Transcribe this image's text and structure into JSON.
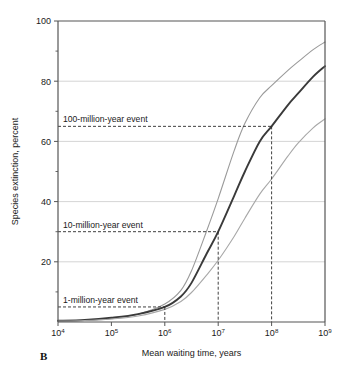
{
  "figure": {
    "panel_label": "B",
    "background_color": "#ffffff"
  },
  "chart_data": {
    "type": "line",
    "title": "",
    "xlabel": "Mean waiting time, years",
    "ylabel": "Species extinction, percent",
    "xscale": "log",
    "xlim": [
      10000,
      1000000000
    ],
    "ylim": [
      0,
      100
    ],
    "grid": "horizontal",
    "legend_position": "none",
    "xticks": [
      10000,
      100000,
      1000000,
      10000000,
      100000000,
      1000000000
    ],
    "xtick_labels": [
      "10⁴",
      "10⁵",
      "10⁶",
      "10⁷",
      "10⁸",
      "10⁹"
    ],
    "xtick_bases": [
      "10",
      "10",
      "10",
      "10",
      "10",
      "10"
    ],
    "xtick_exponents": [
      "4",
      "5",
      "6",
      "7",
      "8",
      "9"
    ],
    "yticks": [
      0,
      20,
      40,
      60,
      80,
      100
    ],
    "ytick_labels": [
      "",
      "20",
      "40",
      "60",
      "80",
      "100"
    ],
    "yticks_minor": [
      10,
      30,
      50,
      70,
      90
    ],
    "gridline_values": [
      20,
      40,
      60,
      80
    ],
    "series": [
      {
        "name": "upper-bound",
        "color": "#9a9a9a",
        "width": 1.1,
        "x": [
          10000,
          31623,
          100000,
          316228,
          1000000,
          2000000,
          3162278,
          6000000,
          10000000,
          20000000,
          31622777,
          60000000,
          100000000,
          200000000,
          316227766,
          600000000,
          1000000000
        ],
        "y": [
          0.3,
          0.5,
          1.1,
          2.6,
          6.0,
          10.5,
          17.0,
          30.0,
          41.0,
          57.0,
          66.0,
          74.5,
          78.5,
          83.5,
          86.5,
          90.5,
          93.0
        ]
      },
      {
        "name": "best-estimate",
        "color": "#3a3a3a",
        "width": 1.9,
        "x": [
          10000,
          31623,
          100000,
          316228,
          1000000,
          2000000,
          3162278,
          6000000,
          10000000,
          20000000,
          31622777,
          60000000,
          100000000,
          200000000,
          316227766,
          600000000,
          1000000000
        ],
        "y": [
          0.4,
          0.7,
          1.4,
          2.6,
          5.0,
          8.5,
          13.0,
          22.5,
          30.0,
          42.0,
          50.0,
          60.0,
          65.0,
          72.0,
          76.0,
          81.5,
          85.0
        ]
      },
      {
        "name": "lower-bound",
        "color": "#a8a8a8",
        "width": 1.1,
        "x": [
          10000,
          31623,
          100000,
          316228,
          1000000,
          2000000,
          3162278,
          6000000,
          10000000,
          20000000,
          31622777,
          60000000,
          100000000,
          200000000,
          316227766,
          600000000,
          1000000000
        ],
        "y": [
          0.3,
          0.5,
          1.0,
          2.0,
          4.2,
          6.8,
          9.8,
          15.5,
          20.5,
          28.5,
          34.5,
          42.5,
          47.5,
          55.0,
          59.5,
          64.5,
          67.5
        ]
      }
    ],
    "annotations": [
      {
        "id": "annot-1-million",
        "label": "1-million-year event",
        "x": 1000000,
        "y": 5.0,
        "label_x": 10000,
        "label_anchor": "start"
      },
      {
        "id": "annot-10-million",
        "label": "10-million-year event",
        "x": 10000000,
        "y": 30.0,
        "label_x": 10000,
        "label_anchor": "start"
      },
      {
        "id": "annot-100-million",
        "label": "100-million-year event",
        "x": 100000000,
        "y": 65.0,
        "label_x": 10000,
        "label_anchor": "start"
      }
    ]
  }
}
